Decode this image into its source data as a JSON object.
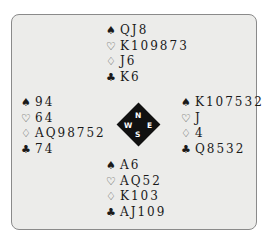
{
  "deal": {
    "north": {
      "spades": "QJ8",
      "hearts": "K109873",
      "diamonds": "J6",
      "clubs": "K6"
    },
    "west": {
      "spades": "94",
      "hearts": "64",
      "diamonds": "AQ98752",
      "clubs": "74"
    },
    "east": {
      "spades": "K107532",
      "hearts": "J",
      "diamonds": "4",
      "clubs": "Q8532"
    },
    "south": {
      "spades": "A6",
      "hearts": "AQ52",
      "diamonds": "K103",
      "clubs": "AJ109"
    }
  },
  "compass": {
    "n": "N",
    "s": "S",
    "w": "W",
    "e": "E"
  },
  "icons": {
    "spade": "♠",
    "heart": "♡",
    "diamond": "♢",
    "club": "♣"
  }
}
